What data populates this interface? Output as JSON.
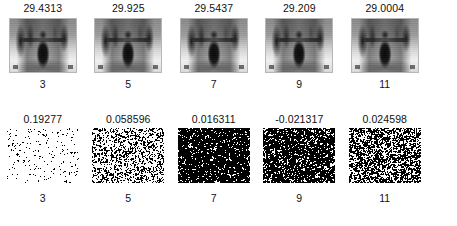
{
  "figure": {
    "background_color": "#ffffff",
    "text_color": "#111111"
  },
  "rows": [
    {
      "name": "denoised-images",
      "panel_type": "photograph",
      "cells": [
        {
          "value": "29.4313",
          "index": "3",
          "noise_density": 0.22
        },
        {
          "value": "29.925",
          "index": "5",
          "noise_density": 0.22
        },
        {
          "value": "29.5437",
          "index": "7",
          "noise_density": 0.22
        },
        {
          "value": "29.209",
          "index": "9",
          "noise_density": 0.22
        },
        {
          "value": "29.0004",
          "index": "11",
          "noise_density": 0.22
        }
      ]
    },
    {
      "name": "residual-noise",
      "panel_type": "noise",
      "cells": [
        {
          "value": "0.19277",
          "index": "3",
          "noise_density": 0.2
        },
        {
          "value": "0.058596",
          "index": "5",
          "noise_density": 0.42
        },
        {
          "value": "0.016311",
          "index": "7",
          "noise_density": 0.74
        },
        {
          "value": "-0.021317",
          "index": "9",
          "noise_density": 0.7
        },
        {
          "value": "0.024598",
          "index": "11",
          "noise_density": 0.55
        }
      ]
    }
  ],
  "chart_data": {
    "type": "table",
    "xlabel": "Iteration index",
    "ylabel": "",
    "categories": [
      "3",
      "5",
      "7",
      "9",
      "11"
    ],
    "series": [
      {
        "name": "PSNR (top row, dB)",
        "values": [
          29.4313,
          29.925,
          29.5437,
          29.209,
          29.0004
        ]
      },
      {
        "name": "Residual mean (bottom row)",
        "values": [
          0.19277,
          0.058596,
          0.016311,
          -0.021317,
          0.024598
        ]
      }
    ],
    "grid": false,
    "legend": "none"
  }
}
